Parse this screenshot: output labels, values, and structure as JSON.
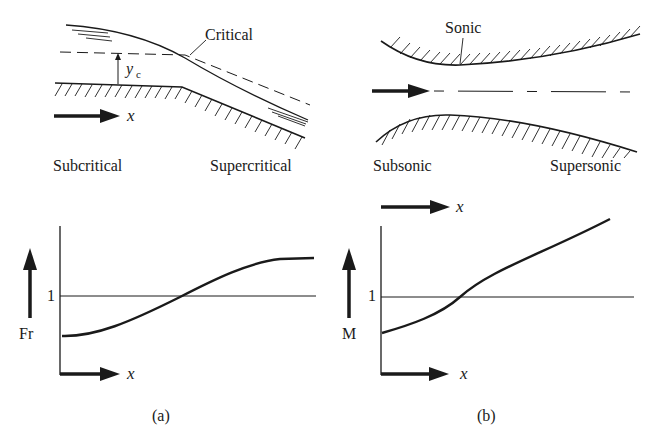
{
  "panel_a": {
    "label": "(a)",
    "channel": {
      "critical_label": "Critical",
      "critical_depth_label": "y",
      "critical_depth_subscript": "c",
      "flow_axis_label": "x",
      "left_regime": "Subcritical",
      "right_regime": "Supercritical"
    },
    "plot": {
      "y_label": "Fr",
      "x_label": "x",
      "reference_tick": "1"
    }
  },
  "panel_b": {
    "label": "(b)",
    "nozzle": {
      "throat_label": "Sonic",
      "left_regime": "Subsonic",
      "right_regime": "Supersonic",
      "flow_axis_label": "x"
    },
    "plot": {
      "y_label": "M",
      "x_label": "x",
      "reference_tick": "1"
    }
  },
  "colors": {
    "ink": "#1a1a1a",
    "background": "#ffffff"
  }
}
